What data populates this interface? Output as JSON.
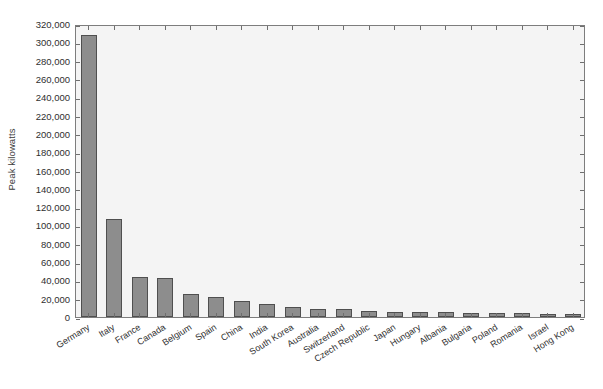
{
  "chart_data": {
    "type": "bar",
    "title": "",
    "subtitle": "",
    "xlabel": "",
    "ylabel": "Peak kilowatts",
    "ylim": [
      0,
      320000
    ],
    "ytick_step": 20000,
    "grid": false,
    "legend": null,
    "bar_color": "#8d8d8d",
    "bar_edge_color": "#4f4f4f",
    "plot_background": "#f4f4f4",
    "axis_color": "#7d7d7d",
    "categories": [
      "Germany",
      "Italy",
      "France",
      "Canada",
      "Belgium",
      "Spain",
      "China",
      "India",
      "South Korea",
      "Australia",
      "Switzerland",
      "Czech Republic",
      "Japan",
      "Hungary",
      "Albania",
      "Bulgaria",
      "Poland",
      "Romania",
      "Israel",
      "Hong Kong"
    ],
    "values": [
      308000,
      107000,
      44000,
      43000,
      25000,
      22000,
      18000,
      14000,
      11000,
      9000,
      9000,
      7000,
      5000,
      5000,
      5000,
      4000,
      4000,
      4000,
      3000,
      3000
    ],
    "ytick_labels": [
      "0",
      "20,000",
      "40,000",
      "60,000",
      "80,000",
      "100,000",
      "120,000",
      "140,000",
      "160,000",
      "180,000",
      "200,000",
      "220,000",
      "240,000",
      "260,000",
      "280,000",
      "300,000",
      "320,000"
    ],
    "ytick_values": [
      0,
      20000,
      40000,
      60000,
      80000,
      100000,
      120000,
      140000,
      160000,
      180000,
      200000,
      220000,
      240000,
      260000,
      280000,
      300000,
      320000
    ]
  }
}
